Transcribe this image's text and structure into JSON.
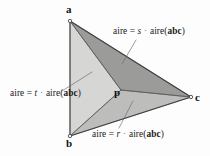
{
  "figure": {
    "type": "geometry-diagram",
    "background_color": "#fdfdfd",
    "outline_color": "#3c3c3c"
  },
  "vertices": [
    {
      "id": "a",
      "label": "a",
      "x": 70,
      "y": 21,
      "label_x": 67,
      "label_y": 6
    },
    {
      "id": "b",
      "label": "b",
      "x": 70,
      "y": 136,
      "label_x": 67,
      "label_y": 139
    },
    {
      "id": "c",
      "label": "c",
      "x": 191,
      "y": 97,
      "label_x": 194,
      "label_y": 96
    },
    {
      "id": "p",
      "label": "p",
      "x": 121,
      "y": 90,
      "label_x": 116,
      "label_y": 91
    }
  ],
  "regions": [
    {
      "id": "apc",
      "name": "upper-region",
      "vertices": [
        "a",
        "p",
        "c"
      ],
      "fill": "#9a9a9a",
      "coefficient": "s"
    },
    {
      "id": "abp",
      "name": "left-region",
      "vertices": [
        "a",
        "b",
        "p"
      ],
      "fill": "#d4d4d4",
      "coefficient": "t"
    },
    {
      "id": "bpc",
      "name": "lower-region",
      "vertices": [
        "b",
        "p",
        "c"
      ],
      "fill": "#bcbcbc",
      "coefficient": "r"
    }
  ],
  "labels": {
    "top": {
      "prefix": "aire",
      "equals": "=",
      "coefficient": "s",
      "dot": "·",
      "area_fn": "aire(",
      "triangle": "abc",
      "close": ")",
      "full_text": "aire = s · aire(abc)",
      "x": 113,
      "y": 30,
      "leader": {
        "x1": 134,
        "y1": 40,
        "x2": 122,
        "y2": 63
      }
    },
    "left": {
      "prefix": "aire",
      "equals": "=",
      "coefficient": "t",
      "dot": "·",
      "area_fn": "aire(",
      "triangle": "abc",
      "close": ")",
      "full_text": "aire = t · aire(abc)",
      "x": 11,
      "y": 92,
      "leader": {
        "x1": 65,
        "y1": 90,
        "x2": 91,
        "y2": 74
      }
    },
    "bottom": {
      "prefix": "aire",
      "equals": "=",
      "coefficient": "r",
      "dot": "·",
      "area_fn": "aire(",
      "triangle": "abc",
      "close": ")",
      "full_text": "aire = r · aire(abc)",
      "x": 93,
      "y": 133,
      "leader": {
        "x1": 121,
        "y1": 128,
        "x2": 132,
        "y2": 101
      }
    }
  }
}
